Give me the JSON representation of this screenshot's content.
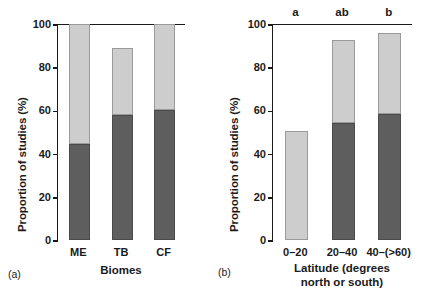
{
  "figure": {
    "panels": [
      {
        "tag": "(a)",
        "ylabel": "Proportion of studies (%)",
        "xlabel_lines": [
          "Biomes"
        ],
        "yticks": [
          "0",
          "20",
          "40",
          "60",
          "80",
          "100"
        ],
        "categories": [
          "ME",
          "TB",
          "CF"
        ],
        "sig_letters": [
          "",
          "",
          ""
        ]
      },
      {
        "tag": "(b)",
        "ylabel": "Proportion of studies (%)",
        "xlabel_lines": [
          "Latitude (degrees",
          "north or south)"
        ],
        "yticks": [
          "0",
          "20",
          "40",
          "60",
          "80",
          "100"
        ],
        "categories": [
          "0–20",
          "20–40",
          "40–(>60)"
        ],
        "sig_letters": [
          "a",
          "ab",
          "b"
        ]
      }
    ]
  },
  "chart_data": [
    {
      "type": "bar",
      "stacked": true,
      "panel": "(a)",
      "title": "",
      "xlabel": "Biomes",
      "ylabel": "Proportion of studies (%)",
      "ylim": [
        0,
        100
      ],
      "yticks": [
        0,
        20,
        40,
        60,
        80,
        100
      ],
      "grid": false,
      "legend": "none",
      "categories": [
        "ME",
        "TB",
        "CF"
      ],
      "series": [
        {
          "name": "dark-gray-segment",
          "color": "#5e5e5e",
          "values": [
            44.5,
            58.0,
            60.0
          ]
        },
        {
          "name": "light-gray-segment",
          "color": "#cdcdcd",
          "values": [
            55.5,
            31.0,
            40.0
          ]
        },
        {
          "name": "white-segment",
          "color": "#ffffff",
          "values": [
            0.0,
            11.0,
            0.0
          ]
        }
      ],
      "cumulative_tops": {
        "dark": [
          44.5,
          58.0,
          60.0
        ],
        "light": [
          100.0,
          89.0,
          100.0
        ]
      },
      "annotations": []
    },
    {
      "type": "bar",
      "stacked": true,
      "panel": "(b)",
      "title": "",
      "xlabel": "Latitude (degrees north or south)",
      "ylabel": "Proportion of studies (%)",
      "ylim": [
        0,
        100
      ],
      "yticks": [
        0,
        20,
        40,
        60,
        80,
        100
      ],
      "grid": false,
      "legend": "none",
      "categories": [
        "0–20",
        "20–40",
        "40–(>60)"
      ],
      "series": [
        {
          "name": "dark-gray-segment",
          "color": "#5e5e5e",
          "values": [
            0.0,
            54.0,
            58.5
          ]
        },
        {
          "name": "light-gray-segment",
          "color": "#cdcdcd",
          "values": [
            50.5,
            38.5,
            37.5
          ]
        },
        {
          "name": "white-segment",
          "color": "#ffffff",
          "values": [
            49.5,
            7.5,
            4.0
          ]
        }
      ],
      "cumulative_tops": {
        "dark": [
          0.0,
          54.0,
          58.5
        ],
        "light": [
          50.5,
          92.5,
          96.0
        ]
      },
      "annotations": [
        "a",
        "ab",
        "b"
      ]
    }
  ],
  "colors": {
    "dark_gray": "#5e5e5e",
    "light_gray": "#cdcdcd",
    "axis": "#1a1a1a",
    "background": "#ffffff"
  }
}
